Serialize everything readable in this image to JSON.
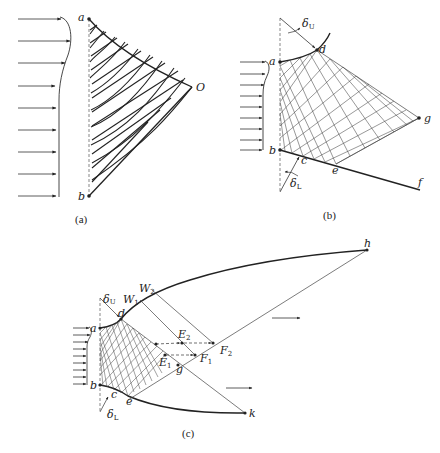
{
  "panels": {
    "a": {
      "caption": "(a)",
      "points": {
        "a": {
          "label": "a",
          "x": 89,
          "y": 19
        },
        "b": {
          "label": "b",
          "x": 89,
          "y": 196
        },
        "O": {
          "label": "O",
          "x": 192,
          "y": 87
        }
      },
      "inflow_arrow_count": 9
    },
    "b": {
      "caption": "(b)",
      "points": {
        "a": {
          "label": "a",
          "x": 280,
          "y": 62
        },
        "b": {
          "label": "b",
          "x": 280,
          "y": 150
        },
        "c": {
          "label": "c",
          "x": 301,
          "y": 154
        },
        "d": {
          "label": "d",
          "x": 317,
          "y": 50
        },
        "e": {
          "label": "e",
          "x": 336,
          "y": 164
        },
        "f": {
          "label": "f",
          "x": 420,
          "y": 188
        },
        "g": {
          "label": "g",
          "x": 419,
          "y": 118
        }
      },
      "angles": {
        "upper": "δU",
        "lower": "δL"
      },
      "inflow_arrow_count": 8
    },
    "c": {
      "caption": "(c)",
      "points": {
        "a": {
          "label": "a",
          "x": 100,
          "y": 328
        },
        "b": {
          "label": "b",
          "x": 100,
          "y": 385
        },
        "c": {
          "label": "c",
          "x": 109,
          "y": 396
        },
        "d": {
          "label": "d",
          "x": 121,
          "y": 319
        },
        "e": {
          "label": "e",
          "x": 128,
          "y": 400
        },
        "g": {
          "label": "g",
          "x": 178,
          "y": 365
        },
        "k": {
          "label": "k",
          "x": 245,
          "y": 413
        },
        "h": {
          "label": "h",
          "x": 367,
          "y": 250
        },
        "E1": {
          "label": "E",
          "sub": "1",
          "x": 165,
          "y": 355
        },
        "E2": {
          "label": "E",
          "sub": "2",
          "x": 182,
          "y": 343
        },
        "F1": {
          "label": "F",
          "sub": "1",
          "x": 195,
          "y": 355
        },
        "F2": {
          "label": "F",
          "sub": "2",
          "x": 213,
          "y": 343
        }
      },
      "waves": {
        "W1": {
          "label": "W",
          "sub": "1"
        },
        "W2": {
          "label": "W",
          "sub": "2"
        }
      },
      "angles": {
        "upper": "δU",
        "lower": "δL"
      },
      "inflow_arrow_count": 10
    }
  },
  "colors": {
    "ink": "#222222",
    "thin_ink": "#444444",
    "background": "#ffffff"
  }
}
